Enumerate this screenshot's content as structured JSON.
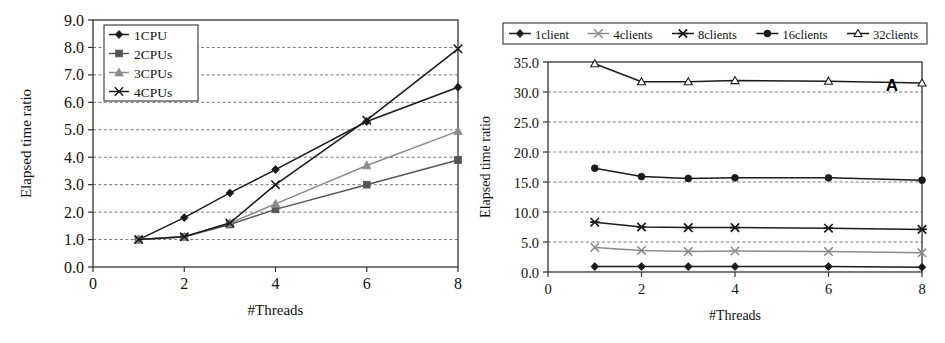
{
  "figure": {
    "annotation_label": "A",
    "colors": {
      "axis": "#333333",
      "grid": "#777777",
      "series_dark": "#1a1a1a",
      "series_mid": "#555555",
      "series_light": "#8a8a8a",
      "background": "#ffffff"
    }
  },
  "chart_data": [
    {
      "id": "left",
      "type": "line",
      "title": "",
      "xlabel": "#Threads",
      "ylabel": "Elapsed time ratio",
      "xlim": [
        0,
        8
      ],
      "ylim": [
        0,
        9
      ],
      "xticks": [
        0,
        2,
        4,
        6,
        8
      ],
      "xtick_labels": [
        "0",
        "2",
        "4",
        "6",
        "8"
      ],
      "yticks": [
        0,
        1,
        2,
        3,
        4,
        5,
        6,
        7,
        8,
        9
      ],
      "ytick_labels": [
        "0.0",
        "1.0",
        "2.0",
        "3.0",
        "4.0",
        "5.0",
        "6.0",
        "7.0",
        "8.0",
        "9.0"
      ],
      "grid": "horizontal-dashed",
      "legend_position": "inside-top-left",
      "x": [
        1,
        2,
        3,
        4,
        6,
        8
      ],
      "series": [
        {
          "name": "1CPU",
          "marker": "diamond",
          "color": "#1a1a1a",
          "values": [
            1.0,
            1.8,
            2.7,
            3.55,
            5.3,
            6.55
          ]
        },
        {
          "name": "2CPUs",
          "marker": "square",
          "color": "#555555",
          "values": [
            1.0,
            1.1,
            1.55,
            2.1,
            3.0,
            3.9
          ]
        },
        {
          "name": "3CPUs",
          "marker": "triangle",
          "color": "#8a8a8a",
          "values": [
            1.0,
            1.1,
            1.6,
            2.3,
            3.7,
            4.95
          ]
        },
        {
          "name": "4CPUs",
          "marker": "cross",
          "color": "#1a1a1a",
          "values": [
            1.0,
            1.1,
            1.6,
            3.0,
            5.35,
            7.95
          ]
        }
      ]
    },
    {
      "id": "right",
      "type": "line",
      "title": "",
      "xlabel": "#Threads",
      "ylabel": "Elapsed time ratio",
      "xlim": [
        0,
        8
      ],
      "ylim": [
        0,
        35
      ],
      "xticks": [
        0,
        2,
        4,
        6,
        8
      ],
      "xtick_labels": [
        "0",
        "2",
        "4",
        "6",
        "8"
      ],
      "yticks": [
        0,
        5,
        10,
        15,
        20,
        25,
        30,
        35
      ],
      "ytick_labels": [
        "0.0",
        "5.0",
        "10.0",
        "15.0",
        "20.0",
        "25.0",
        "30.0",
        "35.0"
      ],
      "grid": "horizontal-dashed",
      "legend_position": "above-plot",
      "x": [
        1,
        2,
        3,
        4,
        6,
        8
      ],
      "series": [
        {
          "name": "1client",
          "marker": "diamond",
          "color": "#1a1a1a",
          "values": [
            0.9,
            0.9,
            0.9,
            0.9,
            0.9,
            0.8
          ]
        },
        {
          "name": "4clients",
          "marker": "cross",
          "color": "#8a8a8a",
          "values": [
            4.1,
            3.6,
            3.4,
            3.5,
            3.4,
            3.2
          ]
        },
        {
          "name": "8clients",
          "marker": "asterisk",
          "color": "#1a1a1a",
          "values": [
            8.3,
            7.5,
            7.4,
            7.4,
            7.3,
            7.1
          ]
        },
        {
          "name": "16clients",
          "marker": "circle",
          "color": "#1a1a1a",
          "values": [
            17.3,
            15.9,
            15.6,
            15.7,
            15.7,
            15.3
          ]
        },
        {
          "name": "32clients",
          "marker": "open-triangle",
          "color": "#1a1a1a",
          "values": [
            34.7,
            31.7,
            31.7,
            31.9,
            31.8,
            31.5
          ]
        }
      ]
    }
  ]
}
